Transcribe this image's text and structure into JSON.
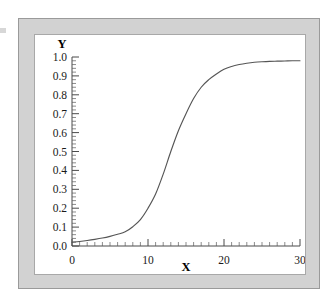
{
  "figure": {
    "frame_color": "#d2d2d2",
    "canvas_color": "#ffffff",
    "curve_color": "#555555",
    "axis_color": "#4a4a4a"
  },
  "chart_data": {
    "type": "line",
    "title": "",
    "subtitle": "",
    "xlabel": "X",
    "ylabel": "Y",
    "xlim": [
      0,
      30
    ],
    "ylim": [
      0.0,
      1.0
    ],
    "grid": false,
    "legend": null,
    "x_ticks": [
      0,
      10,
      20,
      30
    ],
    "x_tick_labels": [
      "0",
      "10",
      "20",
      "30"
    ],
    "x_minor_tick_step": 1,
    "y_ticks": [
      0.0,
      0.1,
      0.2,
      0.3,
      0.4,
      0.5,
      0.6,
      0.7,
      0.8,
      0.9,
      1.0
    ],
    "y_tick_labels": [
      "0.0",
      "0.1",
      "0.2",
      "0.3",
      "0.4",
      "0.5",
      "0.6",
      "0.7",
      "0.8",
      "0.9",
      "1.0"
    ],
    "y_minor_tick_step": 0.02,
    "annotations": [],
    "series": [
      {
        "name": "logistic curve",
        "description": "sigmoid / logistic growth curve rising from about 0.02 at x=0 to about 0.98 at x=30, midpoint near x=13",
        "x": [
          0,
          1,
          2,
          3,
          4,
          5,
          6,
          7,
          8,
          9,
          10,
          11,
          12,
          13,
          14,
          15,
          16,
          17,
          18,
          19,
          20,
          21,
          22,
          23,
          24,
          25,
          26,
          27,
          28,
          29,
          30
        ],
        "values": [
          0.02,
          0.024,
          0.029,
          0.035,
          0.042,
          0.051,
          0.062,
          0.075,
          0.102,
          0.14,
          0.2,
          0.275,
          0.38,
          0.5,
          0.61,
          0.7,
          0.78,
          0.84,
          0.88,
          0.91,
          0.935,
          0.95,
          0.96,
          0.967,
          0.972,
          0.975,
          0.977,
          0.978,
          0.979,
          0.98,
          0.98
        ]
      }
    ]
  }
}
